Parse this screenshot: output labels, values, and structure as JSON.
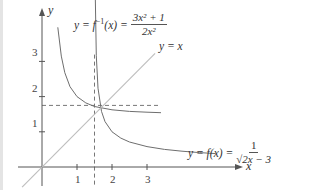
{
  "chart_data": {
    "type": "line",
    "title": "",
    "xlabel": "x",
    "ylabel": "y",
    "xlim": [
      -0.7,
      5.6
    ],
    "ylim": [
      -0.5,
      4.5
    ],
    "grid": false,
    "legend": "none (curves labeled inline)",
    "x_ticks": [
      "1",
      "2",
      "3"
    ],
    "y_ticks": [
      "1",
      "2",
      "3"
    ],
    "series": [
      {
        "name": "y = f(x) = 1/√(2x − 3)",
        "style": "solid",
        "domain": [
          1.52,
          4.96
        ],
        "points": [
          [
            1.52,
            5.0
          ],
          [
            1.55,
            3.16
          ],
          [
            1.6,
            2.24
          ],
          [
            1.7,
            1.58
          ],
          [
            1.8,
            1.29
          ],
          [
            2.0,
            1.0
          ],
          [
            2.25,
            0.82
          ],
          [
            2.5,
            0.71
          ],
          [
            3.0,
            0.58
          ],
          [
            3.5,
            0.5
          ],
          [
            4.0,
            0.45
          ],
          [
            4.5,
            0.41
          ],
          [
            4.96,
            0.38
          ]
        ]
      },
      {
        "name": "y = f⁻¹(x) = (3x² + 1)/(2x²)",
        "style": "solid",
        "domain": [
          0.45,
          3.4
        ],
        "points": [
          [
            0.45,
            3.97
          ],
          [
            0.55,
            3.15
          ],
          [
            0.65,
            2.68
          ],
          [
            0.8,
            2.28
          ],
          [
            1.0,
            2.0
          ],
          [
            1.25,
            1.82
          ],
          [
            1.5,
            1.72
          ],
          [
            2.0,
            1.625
          ],
          [
            2.5,
            1.58
          ],
          [
            3.0,
            1.556
          ],
          [
            3.4,
            1.543
          ]
        ]
      },
      {
        "name": "y = x",
        "style": "solid-light",
        "points": [
          [
            -0.57,
            -0.57
          ],
          [
            3.23,
            3.23
          ]
        ]
      }
    ],
    "reference_lines": [
      {
        "orientation": "vertical",
        "x": 1.5,
        "style": "dashed",
        "y_range": [
          -0.5,
          3.2
        ]
      },
      {
        "orientation": "horizontal",
        "y": 1.75,
        "style": "dashed",
        "x_range": [
          0,
          3.4
        ]
      }
    ],
    "annotations": [
      {
        "text": "y = f⁻¹(x) = (3x² + 1)/(2x²)",
        "near": "inverse curve, top"
      },
      {
        "text": "y = x",
        "near": "line y=x, upper right"
      },
      {
        "text": "y = f(x) = 1/√(2x − 3)",
        "near": "f curve, right"
      }
    ]
  },
  "axes": {
    "x_label": "x",
    "y_label": "y",
    "x_ticks": [
      {
        "value": 1,
        "label": "1"
      },
      {
        "value": 2,
        "label": "2"
      },
      {
        "value": 3,
        "label": "3"
      }
    ],
    "y_ticks": [
      {
        "value": 1,
        "label": "1"
      },
      {
        "value": 2,
        "label": "2"
      },
      {
        "value": 3,
        "label": "3"
      }
    ]
  },
  "labels": {
    "inverse": {
      "lhs": "y = f",
      "sup": "−1",
      "arg": "(x) =",
      "num": "3x² + 1",
      "den": "2x²"
    },
    "identity": "y = x",
    "f": {
      "lhs": "y = f(x) =",
      "num": "1",
      "den": "√2x − 3"
    }
  },
  "colors": {
    "axis": "#555555",
    "curve": "#6e6e6e",
    "identity_line": "#bdbdbd",
    "dashed": "#777777",
    "left_strip": "#e4e4e4"
  }
}
